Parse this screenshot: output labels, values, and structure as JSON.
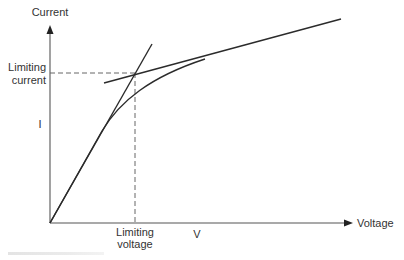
{
  "diagram": {
    "type": "current-voltage-characteristic",
    "axes": {
      "y_label": "Current",
      "x_label": "Voltage",
      "y_symbol": "I",
      "x_symbol": "V"
    },
    "annotations": {
      "limiting_current_line1": "Limiting",
      "limiting_current_line2": "current",
      "limiting_voltage_line1": "Limiting",
      "limiting_voltage_line2": "voltage"
    },
    "elements": [
      "I-V curve rising linearly then saturating",
      "steep tangent line through origin (initial slope)",
      "shallow tangent line along saturation region",
      "dashed projection lines from tangent intersection to both axes"
    ],
    "colors": {
      "line": "#2b2b2b",
      "axis": "#555555",
      "dashed": "#666666",
      "text": "#333333"
    }
  }
}
